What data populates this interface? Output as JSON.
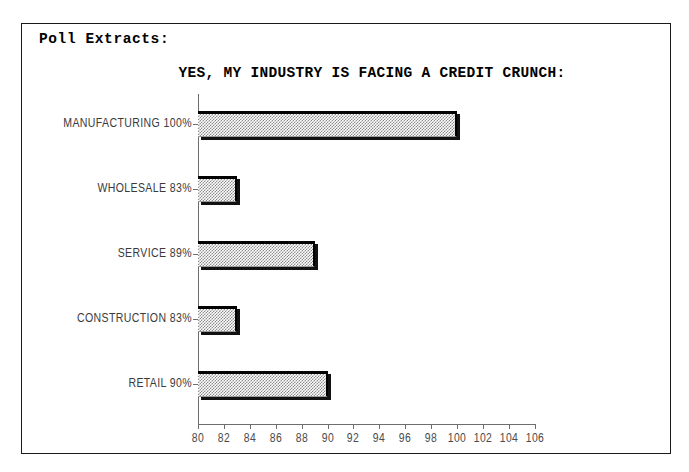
{
  "page": {
    "header_label": "Poll Extracts:"
  },
  "chart_data": {
    "type": "bar",
    "orientation": "horizontal",
    "title": "YES, MY INDUSTRY IS FACING A CREDIT CRUNCH:",
    "xlabel": "",
    "ylabel": "",
    "xlim": [
      80,
      106
    ],
    "xtick_step": 2,
    "grid": false,
    "legend": null,
    "categories": [
      "MANUFACTURING",
      "WHOLESALE",
      "SERVICE",
      "CONSTRUCTION",
      "RETAIL"
    ],
    "values": [
      100,
      83,
      89,
      83,
      90
    ],
    "value_suffix": "%",
    "category_labels": [
      "MANUFACTURING 100%",
      "WHOLESALE 83%",
      "SERVICE 89%",
      "CONSTRUCTION 83%",
      "RETAIL 90%"
    ],
    "xticks": [
      80,
      82,
      84,
      86,
      88,
      90,
      92,
      94,
      96,
      98,
      100,
      102,
      104,
      106
    ],
    "bar_fill_color": "#8c8c8c",
    "bar_edge_color": "#000000",
    "axis_color": "#6e6e6e",
    "frame_color": "#1a1a1a",
    "background_color": "#ffffff"
  }
}
